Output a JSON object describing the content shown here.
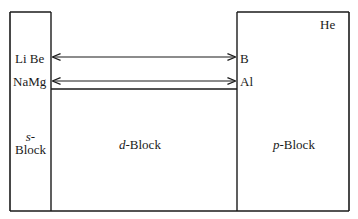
{
  "diagram": {
    "type": "periodic-table-block-outline",
    "blocks": {
      "s": {
        "prefix": "s",
        "suffix": "-",
        "line2": "Block"
      },
      "d": {
        "prefix": "d",
        "suffix": "-Block"
      },
      "p": {
        "prefix": "p",
        "suffix": "-Block"
      }
    },
    "elements": {
      "row2_left": "Li  Be",
      "row3_left": "NaMg",
      "row2_right": "B",
      "row3_right": "Al",
      "noble_gas": "He"
    },
    "arrows": [
      {
        "from": "Be",
        "to": "B",
        "style": "double-headed"
      },
      {
        "from": "Mg",
        "to": "Al",
        "style": "double-headed"
      }
    ],
    "colors": {
      "line": "#1a1a1a",
      "background": "#ffffff"
    }
  }
}
